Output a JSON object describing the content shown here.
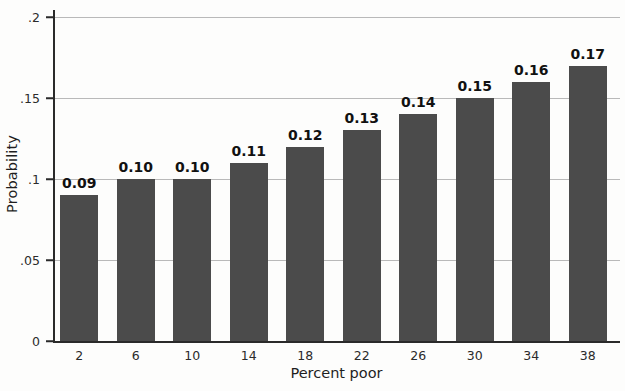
{
  "chart_data": {
    "type": "bar",
    "title": "",
    "xlabel": "Percent poor",
    "ylabel": "Probability",
    "categories": [
      "2",
      "6",
      "10",
      "14",
      "18",
      "22",
      "26",
      "30",
      "34",
      "38"
    ],
    "values": [
      0.09,
      0.1,
      0.1,
      0.11,
      0.12,
      0.13,
      0.14,
      0.15,
      0.16,
      0.17
    ],
    "value_labels": [
      "0.09",
      "0.10",
      "0.10",
      "0.11",
      "0.12",
      "0.13",
      "0.14",
      "0.15",
      "0.16",
      "0.17"
    ],
    "ylim": [
      0,
      0.2
    ],
    "yticks": [
      0,
      0.05,
      0.1,
      0.15,
      0.2
    ],
    "ytick_labels": [
      "0",
      ".05",
      ".1",
      ".15",
      ".2"
    ],
    "grid": "horizontal",
    "legend": "none",
    "bar_color": "#4b4b4b",
    "gridline_color": "#b9b9b9",
    "axis_color": "#2a2a2a",
    "label_color": "#111111"
  }
}
